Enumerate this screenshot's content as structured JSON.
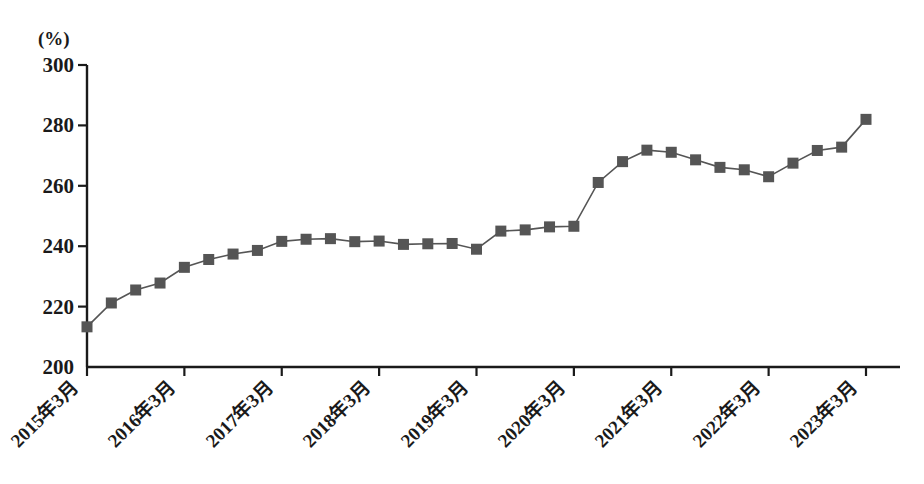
{
  "chart_data": {
    "type": "line",
    "title": "",
    "subtitle": "",
    "xlabel": "",
    "ylabel": "",
    "unit_label": "(%)",
    "ylim": [
      200,
      300
    ],
    "y_ticks": [
      200,
      220,
      240,
      260,
      280,
      300
    ],
    "grid": false,
    "legend": null,
    "marker": "square",
    "marker_color": "#555555",
    "line_color": "#555555",
    "x_tick_labels": [
      "2015年3月",
      "2016年3月",
      "2017年3月",
      "2018年3月",
      "2019年3月",
      "2020年3月",
      "2021年3月",
      "2022年3月",
      "2023年3月"
    ],
    "x_tick_indices": [
      0,
      4,
      8,
      12,
      16,
      20,
      24,
      28,
      32
    ],
    "x": [
      "2015年3月",
      "2015年6月",
      "2015年9月",
      "2015年12月",
      "2016年3月",
      "2016年6月",
      "2016年9月",
      "2016年12月",
      "2017年3月",
      "2017年6月",
      "2017年9月",
      "2017年12月",
      "2018年3月",
      "2018年6月",
      "2018年9月",
      "2018年12月",
      "2019年3月",
      "2019年6月",
      "2019年9月",
      "2019年12月",
      "2020年3月",
      "2020年6月",
      "2020年9月",
      "2020年12月",
      "2021年3月",
      "2021年6月",
      "2021年9月",
      "2021年12月",
      "2022年3月",
      "2022年6月",
      "2022年9月",
      "2022年12月",
      "2023年3月"
    ],
    "values": [
      213.3,
      221.2,
      225.5,
      227.8,
      233.0,
      235.6,
      237.4,
      238.6,
      241.6,
      242.3,
      242.5,
      241.5,
      241.7,
      240.6,
      240.8,
      240.9,
      239.0,
      245.0,
      245.4,
      246.4,
      246.6,
      261.1,
      268.0,
      271.8,
      271.1,
      268.6,
      266.1,
      265.3,
      263.0,
      267.5,
      271.7,
      272.8,
      282.0
    ]
  }
}
